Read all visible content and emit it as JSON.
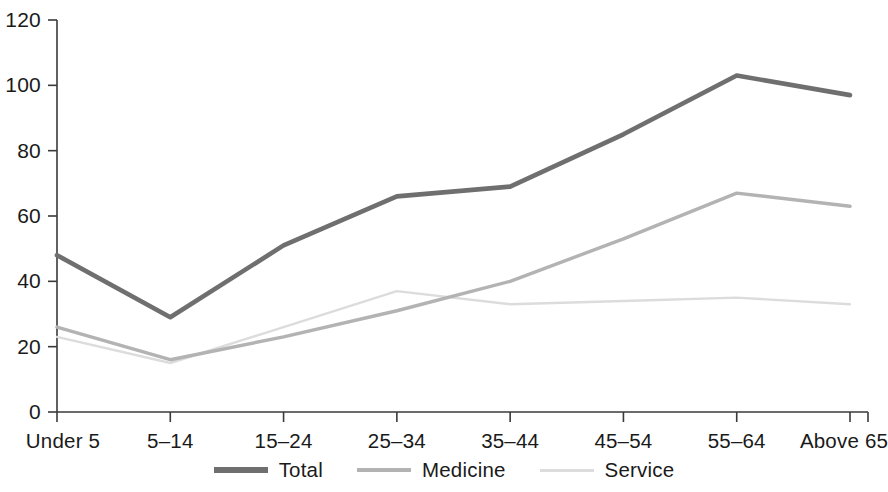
{
  "chart_data": {
    "type": "line",
    "title": "",
    "xlabel": "",
    "ylabel": "",
    "categories": [
      "Under 5",
      "5–14",
      "15–24",
      "25–34",
      "35–44",
      "45–54",
      "55–64",
      "Above 65"
    ],
    "series": [
      {
        "name": "Total",
        "values": [
          48,
          29,
          51,
          66,
          69,
          85,
          103,
          97
        ],
        "color": "#6f6f6f"
      },
      {
        "name": "Medicine",
        "values": [
          26,
          16,
          23,
          31,
          40,
          53,
          67,
          63
        ],
        "color": "#b3b3b3"
      },
      {
        "name": "Service",
        "values": [
          23,
          15,
          26,
          37,
          33,
          34,
          35,
          33
        ],
        "color": "#dcdcdc"
      }
    ],
    "ylim": [
      0,
      120
    ],
    "yticks": [
      0,
      20,
      40,
      60,
      80,
      100,
      120
    ],
    "ytick_labels": [
      "0",
      "20",
      "40",
      "60",
      "80",
      "100",
      "120"
    ],
    "grid": false,
    "legend_position": "bottom",
    "axis_color": "#3a3a3a"
  },
  "legend": {
    "items": [
      {
        "label": "Total"
      },
      {
        "label": "Medicine"
      },
      {
        "label": "Service"
      }
    ]
  }
}
